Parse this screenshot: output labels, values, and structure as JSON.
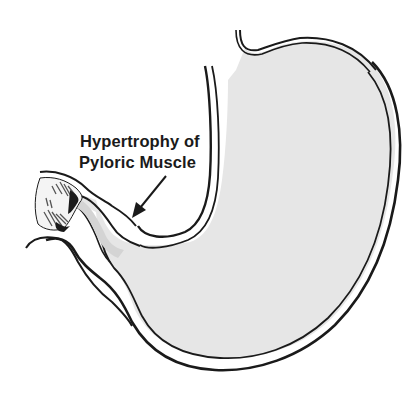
{
  "diagram": {
    "annotation": {
      "line1": "Hypertrophy of",
      "line2": "Pyloric Muscle"
    },
    "colors": {
      "outline": "#1a1a1a",
      "stomach_fill": "#e6e6e6",
      "background": "#ffffff",
      "shading": "#555555"
    }
  }
}
